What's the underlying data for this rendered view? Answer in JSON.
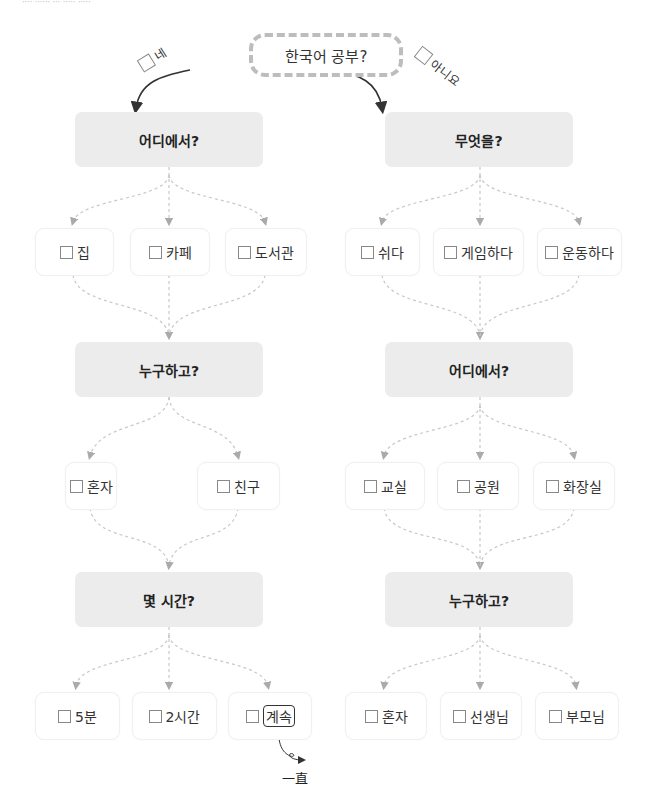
{
  "header_cropped_text": "···· ······ ··· ····· ·····",
  "root": {
    "label": "한국어 공부?"
  },
  "branches": {
    "yes": {
      "label": "네"
    },
    "no": {
      "label": "아니요"
    }
  },
  "left": {
    "q1": "어디에서?",
    "q1_options": [
      "집",
      "카페",
      "도서관"
    ],
    "q2": "누구하고?",
    "q2_options": [
      "혼자",
      "친구"
    ],
    "q3": "몇 시간?",
    "q3_options": [
      "5분",
      "2시간",
      "계속"
    ],
    "annotation": "一直"
  },
  "right": {
    "q1": "무엇을?",
    "q1_options": [
      "쉬다",
      "게임하다",
      "운동하다"
    ],
    "q2": "어디에서?",
    "q2_options": [
      "교실",
      "공원",
      "화장실"
    ],
    "q3": "누구하고?",
    "q3_options": [
      "혼자",
      "선생님",
      "부모님"
    ]
  },
  "colors": {
    "question_bg": "#ececec",
    "dashed_connector": "#c8c8c8",
    "root_border": "#bdbdbd",
    "solid_arrow": "#333333"
  }
}
